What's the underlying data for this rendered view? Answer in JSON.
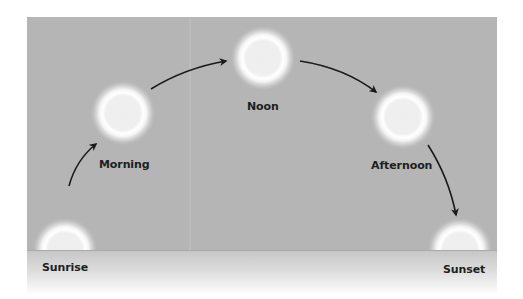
{
  "diagram": {
    "colors": {
      "sky": "#b5b5b5",
      "ground_top": "#c4c4c4",
      "horizon_line": "#a8a8a8",
      "sun_core": "#f1f1f1",
      "sun_ring": "#ffffff",
      "arrow": "#1a1a1a",
      "label": "#1e1e1e"
    },
    "stages": [
      {
        "id": "sunrise",
        "label": "Sunrise",
        "cx": 65,
        "cy": 250,
        "label_x": 42,
        "label_y": 261,
        "partial": true
      },
      {
        "id": "morning",
        "label": "Morning",
        "cx": 123,
        "cy": 113,
        "label_x": 99,
        "label_y": 158,
        "partial": false
      },
      {
        "id": "noon",
        "label": "Noon",
        "cx": 263,
        "cy": 58,
        "label_x": 247,
        "label_y": 100,
        "partial": false
      },
      {
        "id": "afternoon",
        "label": "Afternoon",
        "cx": 403,
        "cy": 117,
        "label_x": 371,
        "label_y": 159,
        "partial": false
      },
      {
        "id": "sunset",
        "label": "Sunset",
        "cx": 460,
        "cy": 250,
        "label_x": 443,
        "label_y": 263,
        "partial": true
      }
    ],
    "arrows": [
      {
        "from": "sunrise",
        "to": "morning"
      },
      {
        "from": "morning",
        "to": "noon"
      },
      {
        "from": "noon",
        "to": "afternoon"
      },
      {
        "from": "afternoon",
        "to": "sunset"
      }
    ]
  }
}
